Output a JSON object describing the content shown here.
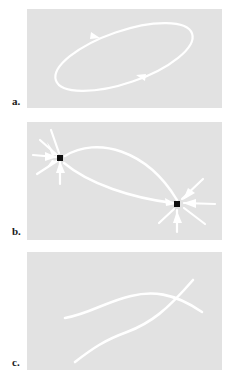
{
  "figure": {
    "caption_labels": [
      "a.",
      "b.",
      "c."
    ],
    "background_color": "#ffffff",
    "panel_background_color": "#e2e2e2",
    "curve_color": "#ffffff",
    "node_color": "#111111",
    "label_color": "#1a1a1a",
    "panel_count": 3
  },
  "panels": [
    {
      "label": "a.",
      "name": "panel-a",
      "description": "closed elliptical orbit with direction arrowheads",
      "x": 27,
      "y": 9,
      "width": 195,
      "height": 99,
      "elements": {
        "ellipse": {
          "center_x": 97,
          "center_y": 48,
          "radius_x": 72,
          "radius_y": 26,
          "rotation_deg": -19,
          "stroke_width": 2.2
        },
        "arrowheads": [
          {
            "name": "arrowhead-upper-left",
            "x": 70,
            "y": 27,
            "angle_deg": 162
          },
          {
            "name": "arrowhead-lower-right",
            "x": 112,
            "y": 67,
            "angle_deg": -18
          }
        ]
      }
    },
    {
      "label": "b.",
      "name": "panel-b",
      "description": "two saddle nodes joined by heteroclinic arcs with radiating separatrix arrows",
      "x": 27,
      "y": 122,
      "width": 195,
      "height": 118,
      "elements": {
        "nodes": [
          {
            "name": "node-left",
            "x": 33,
            "y": 36,
            "size": 5
          },
          {
            "name": "node-right",
            "x": 150,
            "y": 82,
            "size": 5
          }
        ],
        "connecting_arcs": [
          {
            "name": "arc-upper",
            "from": "node-left",
            "to": "node-right",
            "bow": "up"
          },
          {
            "name": "arc-lower",
            "from": "node-left",
            "to": "node-right",
            "bow": "down"
          }
        ],
        "spokes_per_node": 5,
        "stroke_width": 2.2
      }
    },
    {
      "label": "c.",
      "name": "panel-c",
      "description": "two transversally crossing open trajectories",
      "x": 27,
      "y": 252,
      "width": 195,
      "height": 118,
      "elements": {
        "curves": [
          {
            "name": "curve-shallow",
            "orientation": "left-to-right rising then flattening"
          },
          {
            "name": "curve-steep",
            "orientation": "bottom-left to top-right"
          }
        ],
        "crossing_point": {
          "x": 143,
          "y": 43
        },
        "stroke_width": 2.2
      }
    }
  ]
}
